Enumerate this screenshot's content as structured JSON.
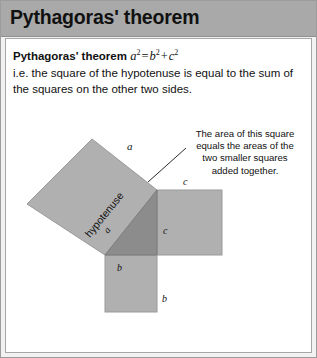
{
  "header": {
    "title": "Pythagoras' theorem"
  },
  "body": {
    "lead_label": "Pythagoras' theorem",
    "formula": {
      "a": "a",
      "a_exp": "2",
      "equals": "=",
      "b": "b",
      "b_exp": "2",
      "plus": "+",
      "c": "c",
      "c_exp": "2",
      "plain": "a2 = b2 + c2"
    },
    "paragraph_line1": "i.e. the square of the hypotenuse is equal to the sum of",
    "paragraph_line2": "the squares on the other two sides."
  },
  "callout": {
    "line1": "The area of this square",
    "line2": "equals the areas of the",
    "line3": "two smaller squares",
    "line4": "added together."
  },
  "diagram": {
    "labels": {
      "square_a": "a",
      "square_b_top": "b",
      "square_b_side": "b",
      "square_c_top": "c",
      "square_c_side": "c",
      "triangle_hypotenuse_word": "hypotenuse",
      "triangle_hypotenuse_letter": "a"
    },
    "colors": {
      "square_fill": "#b0b0b0",
      "triangle_fill": "#8c8c8c",
      "outline": "#8a8a8a",
      "leader_line": "#2b2b2b",
      "header_band": "#a9a9a9",
      "frame_border": "#9c9c9c",
      "page_background": "#ffffff",
      "text": "#111111"
    },
    "geometry": {
      "triangle_vertices": "(100,217) (152,217) (152,152)",
      "square_b_rect": "(100,217) 52x57",
      "square_c_rect": "(152,152) 65x65",
      "square_a_vertices": "(100,217) (152,152) (87,101) (22,166)"
    }
  }
}
